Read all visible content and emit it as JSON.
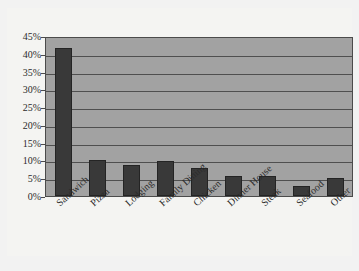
{
  "chart_data": {
    "type": "bar",
    "title": "",
    "subtitle": "",
    "xlabel": "",
    "ylabel": "",
    "categories": [
      "Sandwich",
      "Pizza",
      "Lodging",
      "Family Dining",
      "Chicken",
      "Dinner House",
      "Steak",
      "Seafood",
      "Other"
    ],
    "values": [
      41.5,
      10.0,
      8.7,
      9.8,
      7.8,
      5.7,
      5.5,
      2.8,
      5.2
    ],
    "value_labels": [
      "41.5%",
      "10.0%",
      "8.7%",
      "9.8%",
      "7.8%",
      "5.7%",
      "5.5%",
      "2.8%",
      "5.2%"
    ],
    "ylim": [
      0,
      45
    ],
    "ytick_values": [
      45,
      40,
      35,
      30,
      25,
      20,
      15,
      10,
      5,
      0
    ],
    "ytick_labels": [
      "45%",
      "40%",
      "35%",
      "30%",
      "25%",
      "20%",
      "15%",
      "10%",
      "5%",
      "0%"
    ],
    "grid": true,
    "grid_axis": "y",
    "legend": false,
    "legend_position": "none",
    "bar_color": "#393939",
    "plot_background_color": "#a2a2a2",
    "gridline_color": "#4f4f4f",
    "axis_color": "#4b4b4b",
    "figure_background_color": "#f2f2f2"
  }
}
